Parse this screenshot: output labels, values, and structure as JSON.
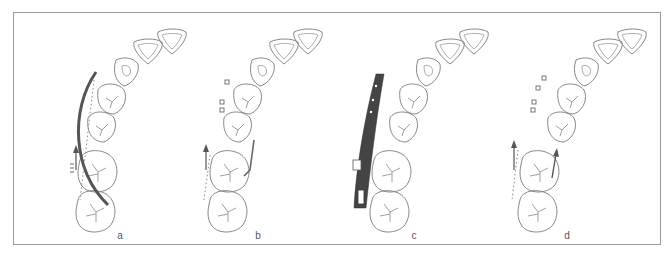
{
  "figure": {
    "panels": [
      {
        "id": "a",
        "label": "a",
        "description": "Continuous archwire from anterior segment to molars with tie-back to canine/premolar region"
      },
      {
        "id": "b",
        "label": "b",
        "description": "Molar with vertical cantilever spring; brackets on premolars"
      },
      {
        "id": "c",
        "label": "c",
        "description": "Rigid sectional bar along buccal segment"
      },
      {
        "id": "d",
        "label": "d",
        "description": "Brackets on premolars, force arrows on molar"
      }
    ],
    "colors": {
      "stroke": "#7a7a7a",
      "wire": "#555555",
      "frame": "#9a9a9a"
    }
  }
}
